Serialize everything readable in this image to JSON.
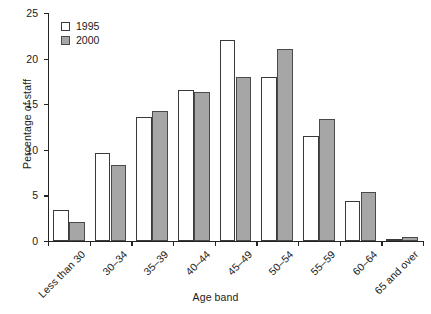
{
  "chart_data": {
    "type": "bar",
    "title": "",
    "xlabel": "Age band",
    "ylabel": "Percentage of staff",
    "categories": [
      "Less than 30",
      "30–34",
      "35–39",
      "40–44",
      "45–49",
      "50–54",
      "55–59",
      "60–64",
      "65 and over"
    ],
    "series": [
      {
        "name": "1995",
        "values": [
          3.4,
          9.6,
          13.6,
          16.6,
          22.0,
          18.0,
          11.5,
          4.4,
          0.1
        ],
        "color": "#ffffff"
      },
      {
        "name": "2000",
        "values": [
          2.1,
          8.3,
          14.3,
          16.3,
          18.0,
          21.0,
          13.4,
          5.4,
          0.4
        ],
        "color": "#a6a6a6"
      }
    ],
    "ylim": [
      0,
      25
    ],
    "yticks": [
      0,
      5,
      10,
      15,
      20,
      25
    ],
    "ytick_labels": [
      "0",
      "5",
      "10",
      "15",
      "20",
      "25"
    ],
    "grid": false,
    "legend_position": "top-left"
  }
}
